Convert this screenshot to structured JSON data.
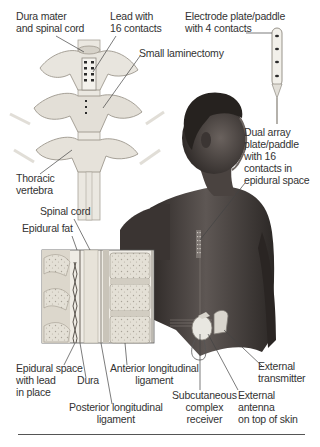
{
  "diagram": {
    "labels": [
      {
        "id": "dura-mater",
        "text": "Dura mater\nand spinal cord",
        "x": 16,
        "y": 12
      },
      {
        "id": "lead-16",
        "text": "Lead with\n16 contacts",
        "x": 110,
        "y": 12
      },
      {
        "id": "laminectomy",
        "text": "Small laminectomy",
        "x": 139,
        "y": 50
      },
      {
        "id": "electrode-paddle",
        "text": "Electrode plate/paddle\nwith 4 contacts",
        "x": 185,
        "y": 12
      },
      {
        "id": "thoracic",
        "text": "Thoracic\nvertebra",
        "x": 16,
        "y": 174
      },
      {
        "id": "dual-array",
        "text": "Dual array\nplate/paddle\nwith 16\ncontacts in\nepidural space",
        "x": 244,
        "y": 128
      },
      {
        "id": "spinal-cord",
        "text": "Spinal cord",
        "x": 40,
        "y": 207
      },
      {
        "id": "epidural-fat",
        "text": "Epidural fat",
        "x": 22,
        "y": 224
      },
      {
        "id": "epidural-space",
        "text": "Epidural space\nwith lead\nin place",
        "x": 16,
        "y": 364
      },
      {
        "id": "dura",
        "text": "Dura",
        "x": 77,
        "y": 376
      },
      {
        "id": "anterior-lig",
        "text": "Anterior longitudinal\nligament",
        "x": 110,
        "y": 364,
        "center": true
      },
      {
        "id": "posterior-lig",
        "text": "Posterior longitudinal\nligament",
        "x": 69,
        "y": 402,
        "center": true
      },
      {
        "id": "subcutaneous",
        "text": "Subcutaneous\ncomplex\nreceiver",
        "x": 172,
        "y": 390,
        "center": true
      },
      {
        "id": "external-antenna",
        "text": "External\nantenna\non top of skin",
        "x": 238,
        "y": 390
      },
      {
        "id": "external-transmitter",
        "text": "External\ntransmitter",
        "x": 258,
        "y": 362
      }
    ],
    "colors": {
      "text": "#333333",
      "leader": "#444444",
      "bone": "#e9e6df",
      "bone_shade": "#b9b4aa",
      "skin_dark": "#3d3836",
      "skin_mid": "#5a5350",
      "hair": "#2a2624",
      "device_light": "#eceae4",
      "contact": "#2b2b2b"
    }
  }
}
